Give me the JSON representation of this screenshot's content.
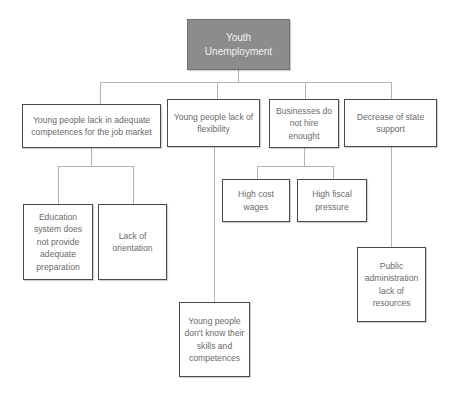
{
  "diagram": {
    "type": "problem-tree",
    "root": {
      "label": "Youth Unemployment"
    },
    "causes": [
      {
        "label": "Young people lack in adequate competences for the job market",
        "children": [
          {
            "label": "Education system does not provide adequate preparation"
          },
          {
            "label": "Lack of orientation"
          }
        ]
      },
      {
        "label": "Young people lack of flexibility",
        "children": [
          {
            "label": "Young people don't know their skills and competences"
          }
        ]
      },
      {
        "label": "Businesses do not hire enought",
        "children": [
          {
            "label": "High cost wages"
          },
          {
            "label": "High fiscal pressure"
          }
        ]
      },
      {
        "label": "Decrease of state support",
        "children": [
          {
            "label": "Public administration lack of resources"
          }
        ]
      }
    ],
    "colors": {
      "root_fill": "#8c8c8c",
      "root_text": "#f0f0f0",
      "box_border": "#4a4a4a",
      "box_text": "#6a6a6a",
      "connector": "#b5b5b5"
    }
  }
}
